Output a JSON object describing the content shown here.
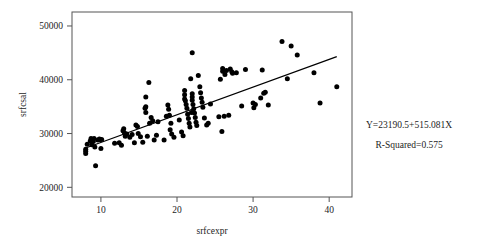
{
  "chart_data": {
    "type": "scatter",
    "title": "",
    "xlabel": "srfcexpr",
    "ylabel": "srfcsal",
    "xlim": [
      6.2,
      43.0
    ],
    "ylim": [
      18200,
      52600
    ],
    "xticks": [
      10,
      20,
      30,
      40
    ],
    "xticklabels": [
      "10",
      "20",
      "30",
      "40"
    ],
    "yticks": [
      20000,
      30000,
      40000,
      50000
    ],
    "yticklabels": [
      "20000",
      "30000",
      "40000",
      "50000"
    ],
    "grid": false,
    "legend": null,
    "marker_color": "#000000",
    "frame_color": "#555555",
    "annotations": [
      "Y=23190.5+515.081X",
      "R-Squared=0.575"
    ],
    "regression": {
      "intercept": 23190.5,
      "slope": 515.081,
      "r_squared": 0.575,
      "x_start": 8.0,
      "x_end": 41.0
    },
    "points": [
      [
        8.0,
        26700
      ],
      [
        8.0,
        27100
      ],
      [
        8.0,
        26300
      ],
      [
        8.2,
        28000
      ],
      [
        8.6,
        28600
      ],
      [
        8.7,
        29100
      ],
      [
        8.8,
        27900
      ],
      [
        9.0,
        28500
      ],
      [
        9.1,
        29100
      ],
      [
        9.2,
        27500
      ],
      [
        9.3,
        24000
      ],
      [
        9.6,
        28800
      ],
      [
        9.8,
        29000
      ],
      [
        9.9,
        28900
      ],
      [
        10.0,
        27200
      ],
      [
        10.1,
        28900
      ],
      [
        11.8,
        28200
      ],
      [
        12.4,
        28300
      ],
      [
        12.7,
        27800
      ],
      [
        12.9,
        30500
      ],
      [
        13.0,
        30900
      ],
      [
        13.1,
        30100
      ],
      [
        13.2,
        29500
      ],
      [
        13.4,
        29900
      ],
      [
        13.8,
        29300
      ],
      [
        14.1,
        29800
      ],
      [
        14.4,
        28300
      ],
      [
        14.6,
        31600
      ],
      [
        14.8,
        31300
      ],
      [
        14.9,
        30000
      ],
      [
        15.2,
        29400
      ],
      [
        15.5,
        28400
      ],
      [
        15.8,
        34700
      ],
      [
        15.9,
        36800
      ],
      [
        15.9,
        35000
      ],
      [
        15.9,
        33900
      ],
      [
        16.1,
        29500
      ],
      [
        16.3,
        39500
      ],
      [
        16.4,
        31900
      ],
      [
        16.6,
        33000
      ],
      [
        16.8,
        32400
      ],
      [
        17.0,
        28800
      ],
      [
        17.3,
        29700
      ],
      [
        17.5,
        32200
      ],
      [
        18.3,
        28800
      ],
      [
        18.6,
        33200
      ],
      [
        18.8,
        35300
      ],
      [
        18.9,
        34500
      ],
      [
        19.0,
        33400
      ],
      [
        19.1,
        30700
      ],
      [
        19.2,
        31900
      ],
      [
        19.3,
        29900
      ],
      [
        19.6,
        29300
      ],
      [
        20.3,
        32500
      ],
      [
        20.6,
        30300
      ],
      [
        20.8,
        29600
      ],
      [
        21.0,
        36400
      ],
      [
        21.0,
        37200
      ],
      [
        21.0,
        38000
      ],
      [
        21.1,
        36100
      ],
      [
        21.2,
        35400
      ],
      [
        21.3,
        34700
      ],
      [
        21.4,
        33600
      ],
      [
        21.5,
        32800
      ],
      [
        21.6,
        31900
      ],
      [
        21.7,
        31200
      ],
      [
        21.8,
        40200
      ],
      [
        21.9,
        33900
      ],
      [
        22.0,
        45000
      ],
      [
        22.0,
        37400
      ],
      [
        22.0,
        36800
      ],
      [
        22.0,
        36200
      ],
      [
        22.1,
        35400
      ],
      [
        22.2,
        34600
      ],
      [
        22.3,
        33800
      ],
      [
        22.4,
        33000
      ],
      [
        22.5,
        32100
      ],
      [
        22.6,
        31500
      ],
      [
        22.8,
        40800
      ],
      [
        23.0,
        38700
      ],
      [
        23.1,
        37600
      ],
      [
        23.2,
        36600
      ],
      [
        23.3,
        35800
      ],
      [
        23.4,
        34900
      ],
      [
        23.6,
        32900
      ],
      [
        23.9,
        31600
      ],
      [
        24.1,
        31900
      ],
      [
        24.4,
        35500
      ],
      [
        25.5,
        33100
      ],
      [
        25.7,
        40100
      ],
      [
        25.9,
        30400
      ],
      [
        26.0,
        41600
      ],
      [
        26.0,
        42100
      ],
      [
        26.2,
        33200
      ],
      [
        26.3,
        41000
      ],
      [
        26.5,
        41700
      ],
      [
        26.8,
        33400
      ],
      [
        27.0,
        42000
      ],
      [
        27.2,
        41500
      ],
      [
        27.3,
        41200
      ],
      [
        27.8,
        41300
      ],
      [
        28.5,
        35100
      ],
      [
        29.0,
        41900
      ],
      [
        30.0,
        35700
      ],
      [
        30.1,
        34800
      ],
      [
        30.3,
        35400
      ],
      [
        31.0,
        36600
      ],
      [
        31.2,
        41800
      ],
      [
        31.4,
        37500
      ],
      [
        31.6,
        37700
      ],
      [
        32.0,
        35300
      ],
      [
        33.8,
        47100
      ],
      [
        34.5,
        40200
      ],
      [
        35.0,
        46300
      ],
      [
        35.8,
        44600
      ],
      [
        38.0,
        41300
      ],
      [
        38.8,
        35700
      ],
      [
        41.0,
        38700
      ]
    ]
  }
}
